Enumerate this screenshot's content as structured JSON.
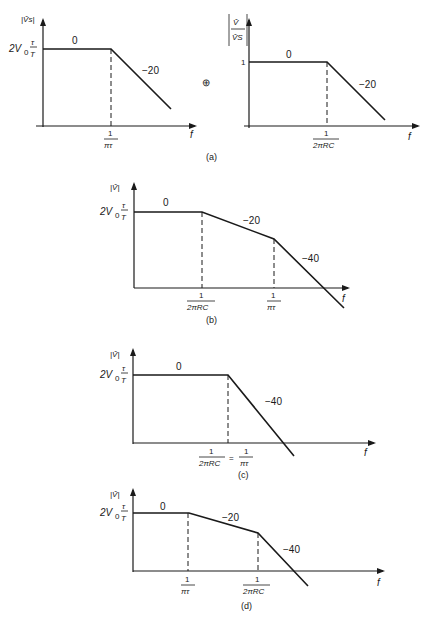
{
  "figure": {
    "panels": [
      {
        "id": "a-left",
        "caption": "(a)",
        "y_label": "|V̂s|",
        "y_level_label": "2V₀ τ/T",
        "x_label": "f",
        "breakpoints": [
          "1/πτ"
        ],
        "slopes": [
          "0",
          "−20"
        ]
      },
      {
        "id": "a-right",
        "y_label": "|V̂/V̂s|",
        "y_level_label": "1",
        "x_label": "f",
        "breakpoints": [
          "1/2πRC"
        ],
        "slopes": [
          "0",
          "−20"
        ]
      },
      {
        "id": "b",
        "caption": "(b)",
        "y_label": "|V̂|",
        "y_level_label": "2V₀ τ/T",
        "x_label": "f",
        "breakpoints": [
          "1/2πRC",
          "1/πτ"
        ],
        "slopes": [
          "0",
          "−20",
          "−40"
        ]
      },
      {
        "id": "c",
        "caption": "(c)",
        "y_label": "|V̂|",
        "y_level_label": "2V₀ τ/T",
        "x_label": "f",
        "breakpoints": [
          "1/2πRC = 1/πτ"
        ],
        "slopes": [
          "0",
          "−40"
        ]
      },
      {
        "id": "d",
        "caption": "(d)",
        "y_label": "|V̂|",
        "y_level_label": "2V₀ τ/T",
        "x_label": "f",
        "breakpoints": [
          "1/πτ",
          "1/2πRC"
        ],
        "slopes": [
          "0",
          "−20",
          "−40"
        ]
      }
    ],
    "operator_symbol": "⊕",
    "text": {
      "zero": "0",
      "m20": "−20",
      "m40": "−40",
      "one": "1",
      "f": "f",
      "two_v0": "2V",
      "sub0": "0",
      "tau": "τ",
      "T": "T",
      "pi_tau": "πτ",
      "two_pi_rc": "2πRC",
      "eq": "=",
      "vs_abs": "|V̂s|",
      "v_abs": "|V̂|",
      "v_num": "V̂",
      "vs_den": "V̂S",
      "cap_a": "(a)",
      "cap_b": "(b)",
      "cap_c": "(c)",
      "cap_d": "(d)",
      "oplus": "⊕"
    }
  }
}
